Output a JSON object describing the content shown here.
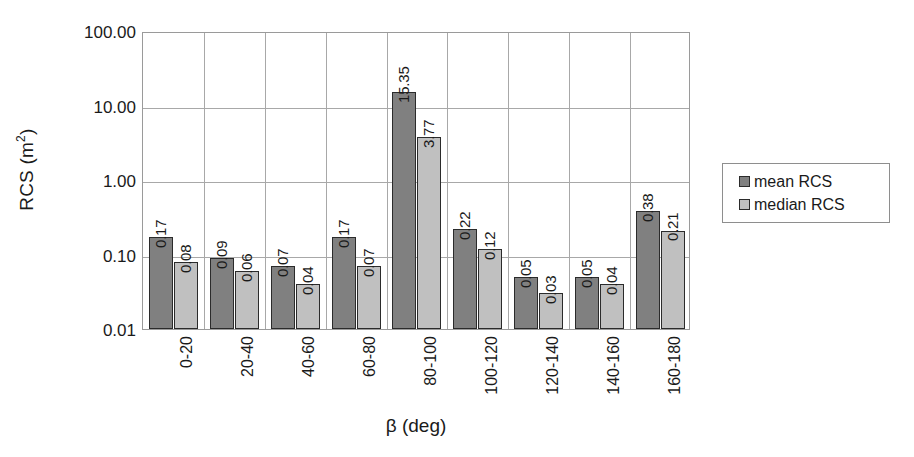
{
  "chart_data": {
    "type": "bar",
    "title": "",
    "xlabel": "β (deg)",
    "ylabel": "RCS (m²)",
    "ylabel_base": "RCS (m",
    "ylabel_sup": "2",
    "ylabel_close": ")",
    "yscale": "log",
    "ylim": [
      0.01,
      100
    ],
    "grid": true,
    "legend_position": "right",
    "categories": [
      "0-20",
      "20-40",
      "40-60",
      "60-80",
      "80-100",
      "100-120",
      "120-140",
      "140-160",
      "160-180"
    ],
    "y_ticks": [
      {
        "value": 100,
        "label": "100.00"
      },
      {
        "value": 10,
        "label": "10.00"
      },
      {
        "value": 1,
        "label": "1.00"
      },
      {
        "value": 0.1,
        "label": "0.10"
      },
      {
        "value": 0.01,
        "label": "0.01"
      }
    ],
    "series": [
      {
        "name": "mean RCS",
        "color": "#808080",
        "values": [
          0.17,
          0.09,
          0.07,
          0.17,
          15.35,
          0.22,
          0.05,
          0.05,
          0.38
        ],
        "labels": [
          "0.17",
          "0.09",
          "0.07",
          "0.17",
          "15.35",
          "0.22",
          "0.05",
          "0.05",
          "0.38"
        ]
      },
      {
        "name": "median RCS",
        "color": "#c0c0c0",
        "values": [
          0.08,
          0.06,
          0.04,
          0.07,
          3.77,
          0.12,
          0.03,
          0.04,
          0.21
        ],
        "labels": [
          "0.08",
          "0.06",
          "0.04",
          "0.07",
          "3.77",
          "0.12",
          "0.03",
          "0.04",
          "0.21"
        ]
      }
    ]
  },
  "legend": {
    "entries": [
      {
        "label": "mean RCS",
        "swatch": "mean"
      },
      {
        "label": "median RCS",
        "swatch": "median"
      }
    ]
  }
}
